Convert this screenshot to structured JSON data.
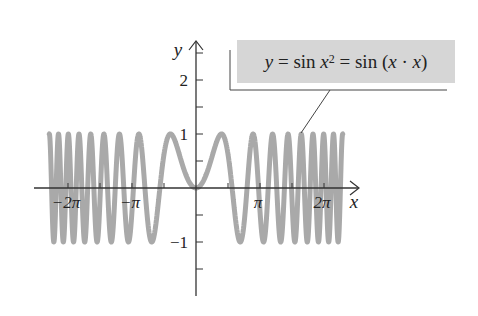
{
  "chart_data": {
    "type": "line",
    "title": "",
    "function": "y = sin(x^2)",
    "annotation": {
      "lhs": "y",
      "eq1": " = sin ",
      "x": "x",
      "exp": "2",
      "eq2": " = sin (",
      "x2": "x",
      "dot": " · ",
      "x3": "x",
      "close": ")"
    },
    "xlabel": "x",
    "ylabel": "y",
    "x_domain": [
      -7.2,
      7.2
    ],
    "xlim": [
      -7.5,
      8.0
    ],
    "ylim": [
      -1.8,
      2.7
    ],
    "x_ticks": [
      {
        "value": -6.2832,
        "label": "−2π"
      },
      {
        "value": -4.7124,
        "label": ""
      },
      {
        "value": -3.1416,
        "label": "−π"
      },
      {
        "value": -1.5708,
        "label": ""
      },
      {
        "value": 1.5708,
        "label": ""
      },
      {
        "value": 3.1416,
        "label": "π"
      },
      {
        "value": 4.7124,
        "label": ""
      },
      {
        "value": 6.2832,
        "label": "2π"
      }
    ],
    "y_ticks": [
      {
        "value": -1.5,
        "label": ""
      },
      {
        "value": -1,
        "label": "−1"
      },
      {
        "value": -0.5,
        "label": ""
      },
      {
        "value": 0.5,
        "label": ""
      },
      {
        "value": 1,
        "label": "1"
      },
      {
        "value": 1.5,
        "label": ""
      },
      {
        "value": 2,
        "label": "2"
      },
      {
        "value": 2.5,
        "label": ""
      }
    ],
    "series": [
      {
        "name": "sin x^2",
        "color": "#a9a9a9",
        "stroke_width": 5,
        "sample_points": [
          {
            "x": 0,
            "y": 0
          },
          {
            "x": 1.2533,
            "y": 1
          },
          {
            "x": 1.7725,
            "y": 0
          },
          {
            "x": 2.1708,
            "y": -1
          },
          {
            "x": 2.5066,
            "y": 0
          },
          {
            "x": -1.2533,
            "y": 1
          },
          {
            "x": -1.7725,
            "y": 0
          },
          {
            "x": -2.1708,
            "y": -1
          }
        ]
      }
    ],
    "grid": false,
    "legend": "none"
  },
  "colors": {
    "curve": "#a9a9a9",
    "axis": "#333333",
    "label_bg": "#d6d6d6"
  }
}
